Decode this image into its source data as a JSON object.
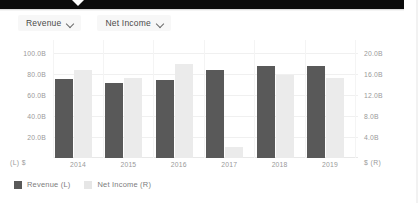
{
  "tooltip_bar": {
    "visible": true
  },
  "selectors": [
    {
      "label": "Revenue",
      "icon": "chevron-down-icon"
    },
    {
      "label": "Net Income",
      "icon": "chevron-down-icon"
    }
  ],
  "axis": {
    "left_unit": "(L)  $",
    "right_unit": "$  (R)",
    "left_ticks": [
      "100.0B",
      "80.0B",
      "60.0B",
      "40.0B",
      "20.0B"
    ],
    "right_ticks": [
      "20.0B",
      "16.0B",
      "12.0B",
      "8.0B",
      "4.0B"
    ]
  },
  "legend": [
    {
      "label": "Revenue (L)",
      "color": "#595959"
    },
    {
      "label": "Net Income (R)",
      "color": "#e6e6e6"
    }
  ],
  "colors": {
    "revenue_bar": "#595959",
    "net_income_bar": "#ebebeb",
    "gridline": "#f0f0f0",
    "tick_text": "#9a9a9a",
    "tooltip": "#0b0b0b"
  },
  "chart_data": {
    "type": "bar",
    "title": "",
    "xlabel": "",
    "ylabel": "$",
    "categories": [
      "2014",
      "2015",
      "2016",
      "2017",
      "2018",
      "2019"
    ],
    "series": [
      {
        "name": "Revenue (L)",
        "axis": "left",
        "unit": "B",
        "color": "#595959",
        "values": [
          74.0,
          70.0,
          73.0,
          82.0,
          86.0,
          86.0
        ]
      },
      {
        "name": "Net Income (R)",
        "axis": "right",
        "unit": "B",
        "color": "#ebebeb",
        "values": [
          16.5,
          15.0,
          17.5,
          2.0,
          15.5,
          15.0
        ]
      }
    ],
    "ylim": [
      0,
      110
    ],
    "y2lim": [
      0,
      22
    ],
    "left_ticks": [
      100,
      80,
      60,
      40,
      20
    ],
    "right_ticks": [
      20,
      16,
      12,
      8,
      4
    ],
    "grid": true,
    "legend_position": "bottom-left"
  }
}
